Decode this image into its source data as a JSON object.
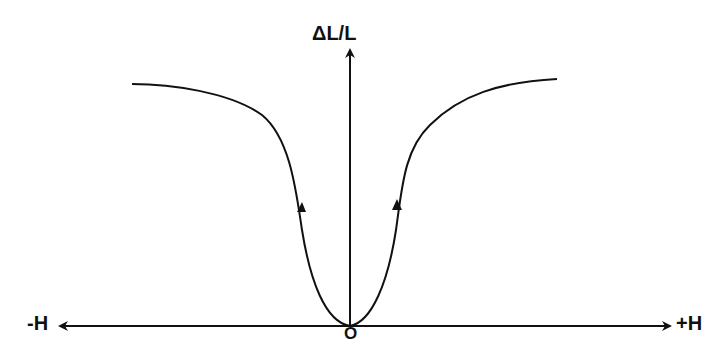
{
  "diagram": {
    "title": "",
    "y_axis_label": "ΔL/L",
    "x_axis_negative_label": "-H",
    "x_axis_positive_label": "+H",
    "origin_label": "O",
    "curve": {
      "description": "Symmetric magnetostriction curve rising from origin and saturating at large |H|",
      "direction_arrows": 2,
      "color": "#111111"
    },
    "axis_color": "#111111"
  }
}
